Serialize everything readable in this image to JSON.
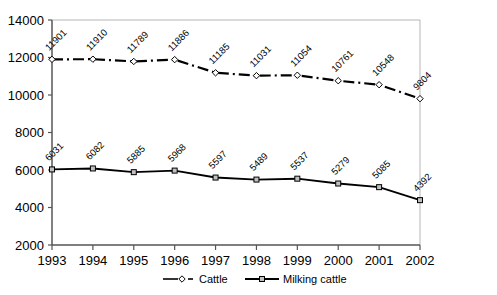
{
  "chart_data": {
    "type": "line",
    "title": "",
    "subtitle": "",
    "xlabel": "",
    "ylabel": "",
    "categories": [
      "1993",
      "1994",
      "1995",
      "1996",
      "1997",
      "1998",
      "1999",
      "2000",
      "2001",
      "2002"
    ],
    "x": [
      1993,
      1994,
      1995,
      1996,
      1997,
      1998,
      1999,
      2000,
      2001,
      2002
    ],
    "series": [
      {
        "name": "Cattle",
        "values": [
          11901,
          11910,
          11789,
          11886,
          11185,
          11031,
          11054,
          10761,
          10548,
          9804
        ],
        "labels": [
          "11901",
          "11910",
          "11789",
          "11886",
          "11185",
          "11031",
          "11054",
          "10761",
          "10548",
          "9804"
        ],
        "line_style": "dash-dot",
        "marker": "open-diamond",
        "color": "#000000"
      },
      {
        "name": "Milking cattle",
        "values": [
          6031,
          6082,
          5885,
          5968,
          5597,
          5489,
          5537,
          5279,
          5085,
          4392
        ],
        "labels": [
          "6031",
          "6082",
          "5885",
          "5968",
          "5597",
          "5489",
          "5537",
          "5279",
          "5085",
          "4392"
        ],
        "line_style": "solid",
        "marker": "filled-square",
        "color": "#000000"
      }
    ],
    "ylim": [
      2000,
      14000
    ],
    "yticks": [
      2000,
      4000,
      6000,
      8000,
      10000,
      12000,
      14000
    ],
    "ytick_labels": [
      "2000",
      "4000",
      "6000",
      "8000",
      "10000",
      "12000",
      "14000"
    ],
    "xtick_labels": [
      "1993",
      "1994",
      "1995",
      "1996",
      "1997",
      "1998",
      "1999",
      "2000",
      "2001",
      "2002"
    ],
    "grid": false,
    "legend_position": "bottom",
    "data_labels_shown": true,
    "data_label_rotation": -45
  },
  "legend": {
    "entries": [
      {
        "label": "Cattle",
        "marker": "open-diamond",
        "line_style": "dash-dot"
      },
      {
        "label": "Milking cattle",
        "marker": "filled-square",
        "line_style": "solid"
      }
    ]
  },
  "colors": {
    "plot_border": "#b5b5b5",
    "axis_line": "#808080",
    "series_line": "#000000",
    "marker_fill": "#c0c0c0",
    "background": "#ffffff",
    "text": "#000000"
  }
}
